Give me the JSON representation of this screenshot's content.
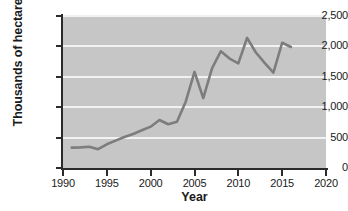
{
  "chart_data": {
    "type": "line",
    "title": "",
    "xlabel": "Year",
    "ylabel": "Thousands of hectares",
    "xlim": [
      1990,
      2020
    ],
    "ylim": [
      0,
      2500
    ],
    "grid": true,
    "legend": "none",
    "line_color": "#7d7d7d",
    "plot_background": "#c6c6c6",
    "gridline_color": "#f2f2f2",
    "axis_color": "#2b2b2b",
    "x_ticks": [
      "1990",
      "1995",
      "2000",
      "2005",
      "2010",
      "2015",
      "2020"
    ],
    "x_tick_values": [
      1990,
      1995,
      2000,
      2005,
      2010,
      2015,
      2020
    ],
    "y_ticks": [
      "0",
      "500",
      "1,000",
      "1,500",
      "2,000",
      "2,500"
    ],
    "y_tick_values": [
      0,
      500,
      1000,
      1500,
      2000,
      2500
    ],
    "series": [
      {
        "name": "Area",
        "x": [
          1991,
          1992,
          1993,
          1994,
          1995,
          1996,
          1997,
          1998,
          1999,
          2000,
          2001,
          2002,
          2003,
          2004,
          2005,
          2006,
          2007,
          2008,
          2009,
          2010,
          2011,
          2012,
          2013,
          2014,
          2015,
          2016
        ],
        "values": [
          335,
          340,
          350,
          310,
          390,
          450,
          510,
          560,
          620,
          680,
          790,
          720,
          760,
          1090,
          1580,
          1150,
          1640,
          1920,
          1800,
          1720,
          2140,
          1900,
          1730,
          1570,
          2060,
          1990
        ]
      }
    ]
  }
}
